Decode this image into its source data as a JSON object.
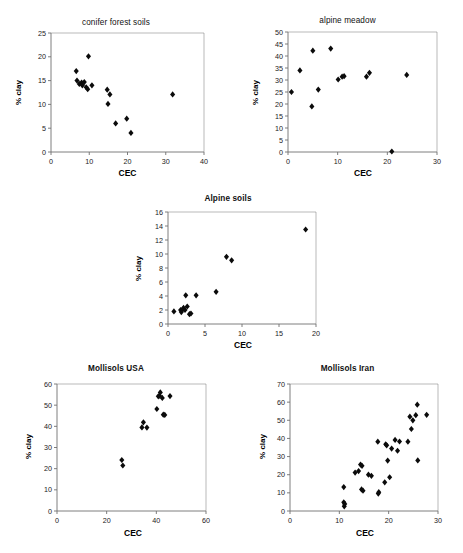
{
  "figure": {
    "axis_color": "#6f6f6f",
    "marker_color": "#0b0b0b",
    "background": "#ffffff"
  },
  "charts": [
    {
      "id": "conifer-forest-soils",
      "title": "conifer forest soils",
      "title_bold": false,
      "xlabel": "CEC",
      "ylabel": "% clay",
      "xticks": [
        0,
        10,
        20,
        30,
        40
      ],
      "yticks": [
        0,
        5,
        10,
        15,
        20,
        25
      ],
      "xlim": [
        0,
        40
      ],
      "ylim": [
        0,
        25
      ],
      "points": [
        [
          6.6,
          17.0
        ],
        [
          6.8,
          15.0
        ],
        [
          7.4,
          14.3
        ],
        [
          8.0,
          14.6
        ],
        [
          8.2,
          14.0
        ],
        [
          8.7,
          14.7
        ],
        [
          9.2,
          13.6
        ],
        [
          9.6,
          13.2
        ],
        [
          9.8,
          20.1
        ],
        [
          10.7,
          14.0
        ],
        [
          14.7,
          13.1
        ],
        [
          14.9,
          10.1
        ],
        [
          15.4,
          12.1
        ],
        [
          16.9,
          6.0
        ],
        [
          19.8,
          7.0
        ],
        [
          20.9,
          4.0
        ],
        [
          31.8,
          12.1
        ]
      ]
    },
    {
      "id": "alpine-meadow",
      "title": "alpine meadow",
      "title_bold": false,
      "xlabel": "CEC",
      "ylabel": "% clay",
      "xticks": [
        0,
        10,
        20,
        30
      ],
      "yticks": [
        0,
        5,
        10,
        15,
        20,
        25,
        30,
        35,
        40,
        45,
        50
      ],
      "xlim": [
        0,
        30
      ],
      "ylim": [
        0,
        50
      ],
      "points": [
        [
          0.7,
          25.0
        ],
        [
          2.4,
          34.0
        ],
        [
          4.8,
          19.0
        ],
        [
          5.0,
          42.2
        ],
        [
          6.1,
          26.0
        ],
        [
          8.6,
          43.1
        ],
        [
          10.1,
          30.2
        ],
        [
          10.9,
          31.4
        ],
        [
          11.3,
          31.6
        ],
        [
          15.8,
          31.4
        ],
        [
          16.4,
          33.0
        ],
        [
          20.9,
          0.2
        ],
        [
          23.9,
          32.1
        ]
      ]
    },
    {
      "id": "alpine-soils",
      "title": "Alpine soils",
      "title_bold": true,
      "xlabel": "CEC",
      "ylabel": "% clay",
      "xticks": [
        0,
        5,
        10,
        15,
        20
      ],
      "yticks": [
        0,
        2,
        4,
        6,
        8,
        10,
        12,
        14,
        16
      ],
      "xlim": [
        0,
        20
      ],
      "ylim": [
        0,
        16
      ],
      "points": [
        [
          0.8,
          1.8
        ],
        [
          1.7,
          2.0
        ],
        [
          1.8,
          1.7
        ],
        [
          2.0,
          2.1
        ],
        [
          2.1,
          2.3
        ],
        [
          2.3,
          2.0
        ],
        [
          2.4,
          4.1
        ],
        [
          2.6,
          2.5
        ],
        [
          2.9,
          1.4
        ],
        [
          3.1,
          1.5
        ],
        [
          3.8,
          4.1
        ],
        [
          6.5,
          4.6
        ],
        [
          7.9,
          9.6
        ],
        [
          8.6,
          9.1
        ],
        [
          18.6,
          13.5
        ]
      ]
    },
    {
      "id": "mollisols-usa",
      "title": "Mollisols USA",
      "title_bold": true,
      "xlabel": "CEC",
      "ylabel": "% clay",
      "xticks": [
        0,
        20,
        40,
        60
      ],
      "yticks": [
        0,
        10,
        20,
        30,
        40,
        50,
        60
      ],
      "xlim": [
        0,
        60
      ],
      "ylim": [
        0,
        60
      ],
      "points": [
        [
          26.1,
          24.1
        ],
        [
          26.5,
          21.5
        ],
        [
          34.2,
          39.5
        ],
        [
          34.8,
          41.9
        ],
        [
          36.2,
          39.4
        ],
        [
          40.2,
          48.2
        ],
        [
          40.8,
          54.2
        ],
        [
          41.3,
          54.5
        ],
        [
          41.6,
          56.0
        ],
        [
          42.4,
          53.4
        ],
        [
          42.8,
          45.5
        ],
        [
          43.4,
          45.4
        ],
        [
          45.5,
          54.3
        ]
      ]
    },
    {
      "id": "mollisols-iran",
      "title": "Mollisols Iran",
      "title_bold": true,
      "xlabel": "CEC",
      "ylabel": "% clay",
      "xticks": [
        0,
        10,
        20,
        30
      ],
      "yticks": [
        0,
        10,
        20,
        30,
        40,
        50,
        60,
        70
      ],
      "xlim": [
        0,
        30
      ],
      "ylim": [
        0,
        70
      ],
      "points": [
        [
          10.9,
          13.2
        ],
        [
          10.9,
          4.8
        ],
        [
          11.0,
          2.6
        ],
        [
          11.1,
          3.9
        ],
        [
          13.2,
          21.2
        ],
        [
          13.9,
          22.0
        ],
        [
          14.3,
          25.6
        ],
        [
          14.5,
          11.9
        ],
        [
          14.6,
          24.9
        ],
        [
          14.8,
          11.2
        ],
        [
          15.9,
          20.0
        ],
        [
          16.5,
          19.4
        ],
        [
          17.8,
          38.2
        ],
        [
          17.9,
          9.6
        ],
        [
          18.0,
          10.4
        ],
        [
          19.2,
          15.8
        ],
        [
          19.4,
          36.8
        ],
        [
          19.6,
          36.2
        ],
        [
          19.8,
          27.8
        ],
        [
          20.2,
          18.6
        ],
        [
          20.6,
          34.4
        ],
        [
          21.3,
          39.2
        ],
        [
          21.8,
          33.2
        ],
        [
          22.2,
          38.3
        ],
        [
          23.9,
          38.2
        ],
        [
          24.3,
          52.0
        ],
        [
          24.6,
          45.2
        ],
        [
          24.9,
          50.0
        ],
        [
          25.5,
          52.8
        ],
        [
          25.8,
          58.6
        ],
        [
          25.9,
          27.9
        ],
        [
          27.7,
          53.0
        ]
      ]
    }
  ]
}
